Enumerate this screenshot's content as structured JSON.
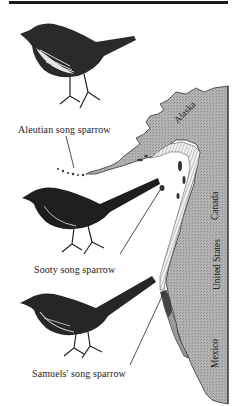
{
  "figure": {
    "birds": [
      {
        "name": "Aleutian song sparrow"
      },
      {
        "name": "Sooty song sparrow"
      },
      {
        "name": "Samuels' song sparrow"
      }
    ],
    "map": {
      "regions": [
        "Alaska",
        "Canada",
        "United States",
        "Mexico"
      ],
      "land_color": "#a9a9a9",
      "border_color": "#333333"
    }
  }
}
